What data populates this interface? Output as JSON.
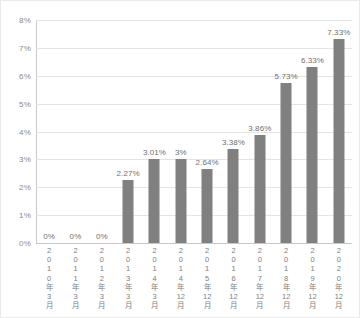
{
  "chart_data": {
    "type": "bar",
    "title": "",
    "subtitle": "",
    "xlabel": "",
    "ylabel": "",
    "ylim": [
      0,
      8
    ],
    "yunit": "%",
    "grid": true,
    "legend": false,
    "bar_color": "#808080",
    "gridline_color": "#e4e4e4",
    "axis_color": "#c8c8c8",
    "label_color": "#8a8a8a",
    "yticks": [
      "0%",
      "1%",
      "2%",
      "3%",
      "4%",
      "5%",
      "6%",
      "7%",
      "8%"
    ],
    "ytick_values": [
      0,
      1,
      2,
      3,
      4,
      5,
      6,
      7,
      8
    ],
    "categories": [
      "2010年3月",
      "2011年3月",
      "2012年3月",
      "2013年3月",
      "2014年3月",
      "2014年12月",
      "2015年12月",
      "2016年12月",
      "2017年12月",
      "2018年12月",
      "2019年12月",
      "2020年12月"
    ],
    "category_chars": [
      [
        "2",
        "0",
        "1",
        "0",
        "年",
        "3",
        "月"
      ],
      [
        "2",
        "0",
        "1",
        "1",
        "年",
        "3",
        "月"
      ],
      [
        "2",
        "0",
        "1",
        "2",
        "年",
        "3",
        "月"
      ],
      [
        "2",
        "0",
        "1",
        "3",
        "年",
        "3",
        "月"
      ],
      [
        "2",
        "0",
        "1",
        "4",
        "年",
        "3",
        "月"
      ],
      [
        "2",
        "0",
        "1",
        "4",
        "年",
        "12",
        "月"
      ],
      [
        "2",
        "0",
        "1",
        "5",
        "年",
        "12",
        "月"
      ],
      [
        "2",
        "0",
        "1",
        "6",
        "年",
        "12",
        "月"
      ],
      [
        "2",
        "0",
        "1",
        "7",
        "年",
        "12",
        "月"
      ],
      [
        "2",
        "0",
        "1",
        "8",
        "年",
        "12",
        "月"
      ],
      [
        "2",
        "0",
        "1",
        "9",
        "年",
        "12",
        "月"
      ],
      [
        "2",
        "0",
        "2",
        "0",
        "年",
        "12",
        "月"
      ]
    ],
    "values": [
      0,
      0,
      0,
      2.27,
      3.01,
      3,
      2.64,
      3.38,
      3.86,
      5.73,
      6.33,
      7.33
    ],
    "data_labels": [
      "0%",
      "0%",
      "0%",
      "2.27%",
      "3.01%",
      "3%",
      "2.64%",
      "3.38%",
      "3.86%",
      "5.73%",
      "6.33%",
      "7.33%"
    ]
  }
}
